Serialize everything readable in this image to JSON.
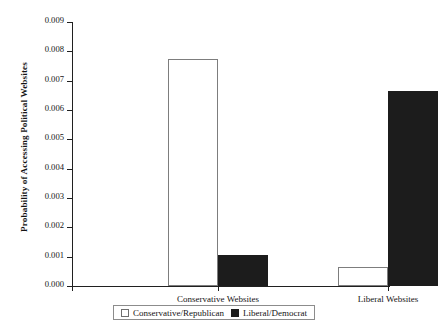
{
  "chart_data": {
    "type": "bar",
    "title": "",
    "xlabel": "",
    "ylabel": "Probability of Accessing Political Websites",
    "categories": [
      "Conservative Websites",
      "Liberal Websites"
    ],
    "series": [
      {
        "name": "Conservative/Republican",
        "color": "#ffffff",
        "values": [
          0.00775,
          0.00065
        ]
      },
      {
        "name": "Liberal/Democrat",
        "color": "#1c1c1c",
        "values": [
          0.00105,
          0.00665
        ]
      }
    ],
    "ylim": [
      0.0,
      0.009
    ],
    "ytick_values": [
      0.0,
      0.001,
      0.002,
      0.003,
      0.004,
      0.005,
      0.006,
      0.007,
      0.008,
      0.009
    ],
    "ytick_labels": [
      "0.000",
      "0.001",
      "0.002",
      "0.003",
      "0.004",
      "0.005",
      "0.006",
      "0.007",
      "0.008",
      "0.009"
    ],
    "grid": false,
    "legend_position": "bottom"
  },
  "legend": {
    "entries": [
      {
        "label": "Conservative/Republican",
        "swatch": "light"
      },
      {
        "label": "Liberal/Democrat",
        "swatch": "dark"
      }
    ]
  }
}
